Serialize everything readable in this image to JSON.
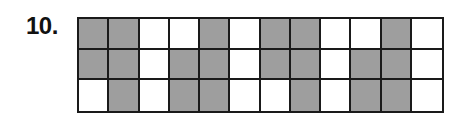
{
  "problem": {
    "number": "10."
  },
  "grid": {
    "rows": 3,
    "columns": 12,
    "colors": {
      "shaded": "#9e9e9e",
      "unshaded": "#ffffff",
      "border": "#1a1a1a"
    },
    "cells": [
      [
        1,
        1,
        0,
        0,
        1,
        0,
        1,
        1,
        0,
        0,
        1,
        0
      ],
      [
        1,
        1,
        0,
        1,
        1,
        0,
        1,
        1,
        0,
        1,
        1,
        0
      ],
      [
        0,
        1,
        0,
        1,
        1,
        0,
        0,
        1,
        0,
        1,
        1,
        0
      ]
    ],
    "shaded_count": 21,
    "total_count": 36
  }
}
